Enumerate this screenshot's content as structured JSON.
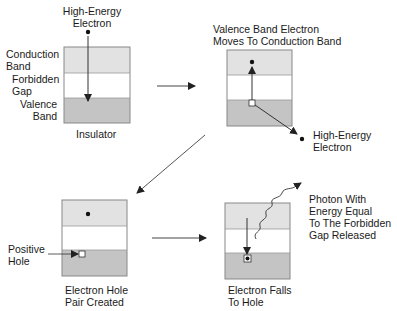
{
  "colors": {
    "conduction": "#e2e2e2",
    "forbidden": "#ffffff",
    "valence": "#c4c4c4",
    "line": "#333333",
    "border": "#888888"
  },
  "panel1": {
    "top_label": "High-Energy\nElectron",
    "conduction_label": "Conduction\nBand",
    "forbidden_label": "Forbidden\nGap",
    "valence_label": "Valence\nBand",
    "caption": "Insulator"
  },
  "panel2": {
    "title": "Valence Band Electron\nMoves To Conduction Band",
    "electron_label": "High-Energy\nElectron"
  },
  "panel3": {
    "hole_label": "Positive\nHole",
    "caption": "Electron Hole\nPair Created"
  },
  "panel4": {
    "photon_label": "Photon With\nEnergy Equal\nTo The Forbidden\nGap Released",
    "caption": "Electron Falls\nTo Hole"
  }
}
